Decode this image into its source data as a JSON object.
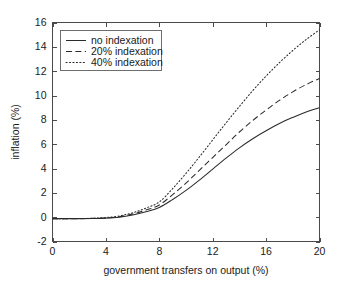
{
  "chart_data": {
    "type": "line",
    "title": "",
    "xlabel": "government transfers on output (%)",
    "ylabel": "inflation (%)",
    "xlim": [
      0,
      20
    ],
    "ylim": [
      -2,
      16
    ],
    "xticks": [
      0,
      4,
      8,
      12,
      16,
      20
    ],
    "yticks": [
      -2,
      0,
      2,
      4,
      6,
      8,
      10,
      12,
      14,
      16
    ],
    "xticklabels": [
      "0",
      "4",
      "8",
      "12",
      "16",
      "20"
    ],
    "yticklabels": [
      "-2",
      "0",
      "2",
      "4",
      "6",
      "8",
      "10",
      "12",
      "14",
      "16"
    ],
    "grid": false,
    "legend_position": "upper left (inside axes)",
    "x": [
      0,
      1,
      2,
      3,
      4,
      5,
      6,
      7,
      8,
      9,
      10,
      11,
      12,
      13,
      14,
      15,
      16,
      17,
      18,
      19,
      20
    ],
    "series": [
      {
        "name": "no indexation",
        "style": "solid",
        "color": "#2b2b2b",
        "values": [
          -0.12,
          -0.12,
          -0.12,
          -0.11,
          -0.08,
          0.0,
          0.18,
          0.45,
          0.8,
          1.45,
          2.2,
          3.05,
          3.95,
          4.85,
          5.7,
          6.45,
          7.1,
          7.7,
          8.2,
          8.65,
          9.0
        ]
      },
      {
        "name": "20% indexation",
        "style": "dashed",
        "color": "#2b2b2b",
        "values": [
          -0.12,
          -0.12,
          -0.12,
          -0.1,
          -0.06,
          0.04,
          0.26,
          0.58,
          1.0,
          1.85,
          2.8,
          3.85,
          4.9,
          5.95,
          7.0,
          7.95,
          8.8,
          9.6,
          10.3,
          10.9,
          11.4
        ]
      },
      {
        "name": "40% indexation",
        "style": "dotted",
        "color": "#2b2b2b",
        "values": [
          -0.12,
          -0.12,
          -0.11,
          -0.09,
          -0.03,
          0.1,
          0.36,
          0.75,
          1.25,
          2.35,
          3.6,
          4.95,
          6.35,
          7.75,
          9.1,
          10.4,
          11.6,
          12.7,
          13.7,
          14.6,
          15.4
        ]
      }
    ],
    "legend_entries": [
      "no indexation",
      "20% indexation",
      "40% indexation"
    ]
  }
}
